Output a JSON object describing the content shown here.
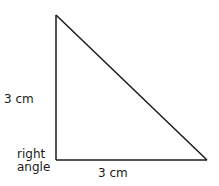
{
  "diagram": {
    "type": "right-triangle",
    "stroke_color": "#1a1a1a",
    "background": "#ffffff",
    "vertices": {
      "top": [
        56,
        15
      ],
      "right_angle_corner": [
        56,
        160
      ],
      "bottom_right": [
        207,
        160
      ]
    },
    "labels": {
      "vertical_side": "3 cm",
      "horizontal_side": "3 cm",
      "right_angle_line1": "right",
      "right_angle_line2": "angle"
    }
  }
}
